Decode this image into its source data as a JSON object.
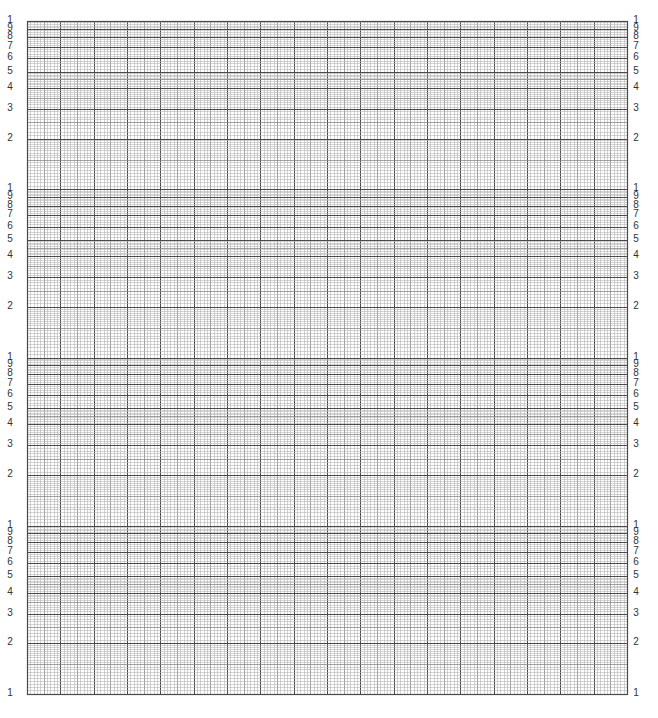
{
  "paper": {
    "type": "semi-log graph paper",
    "log_cycles": 4,
    "linear_major_divisions": 18,
    "linear_minor_per_major": 10,
    "grid": {
      "left": 27,
      "top": 21,
      "right": 627,
      "bottom": 694
    },
    "colors": {
      "background": "#ffffff",
      "minor_line": "#b5b5b5",
      "medium_line": "#8a8a8a",
      "major_line": "#4a4a4a",
      "label": "#333333"
    }
  },
  "axis_labels": {
    "cycle_labels": [
      "1",
      "9",
      "8",
      "7",
      "6",
      "5",
      "4",
      "3",
      "2"
    ],
    "cycle_values": [
      10,
      9,
      8,
      7,
      6,
      5,
      4,
      3,
      2
    ],
    "bottom_label": "1"
  },
  "left_labels": [],
  "right_labels": []
}
